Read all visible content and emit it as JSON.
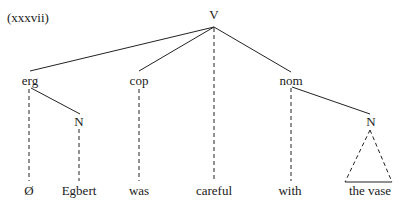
{
  "example_label": "(xxxvii)",
  "tree": {
    "root": "V",
    "nodes": {
      "erg": "erg",
      "cop": "cop",
      "nom": "nom",
      "erg_n": "N",
      "nom_n": "N"
    },
    "leaves": [
      "Ø",
      "Egbert",
      "was",
      "careful",
      "with",
      "the vase"
    ]
  }
}
